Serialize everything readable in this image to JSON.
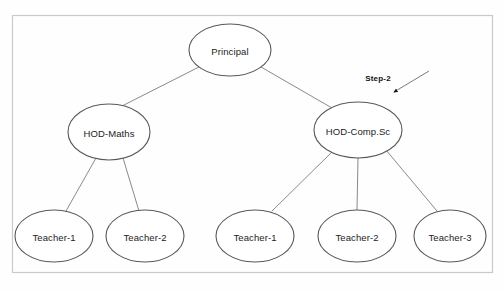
{
  "diagram": {
    "type": "organizational-hierarchy-tree",
    "frame": {
      "x": 12,
      "y": 15,
      "width": 480,
      "height": 257
    },
    "nodes": [
      {
        "id": "principal",
        "label": "Principal",
        "cx": 230,
        "cy": 50,
        "rx": 41,
        "ry": 26,
        "level": 0
      },
      {
        "id": "hod-maths",
        "label": "HOD-Maths",
        "cx": 109,
        "cy": 132,
        "rx": 41,
        "ry": 28,
        "level": 1
      },
      {
        "id": "hod-comp-sc",
        "label": "HOD-Comp.Sc",
        "cx": 358,
        "cy": 130,
        "rx": 44,
        "ry": 28,
        "level": 1
      },
      {
        "id": "teacher-m1",
        "label": "Teacher-1",
        "cx": 54,
        "cy": 236,
        "rx": 39,
        "ry": 26,
        "level": 2
      },
      {
        "id": "teacher-m2",
        "label": "Teacher-2",
        "cx": 145,
        "cy": 236,
        "rx": 39,
        "ry": 26,
        "level": 2
      },
      {
        "id": "teacher-c1",
        "label": "Teacher-1",
        "cx": 255,
        "cy": 236,
        "rx": 39,
        "ry": 26,
        "level": 2
      },
      {
        "id": "teacher-c2",
        "label": "Teacher-2",
        "cx": 357,
        "cy": 236,
        "rx": 39,
        "ry": 26,
        "level": 2
      },
      {
        "id": "teacher-c3",
        "label": "Teacher-3",
        "cx": 450,
        "cy": 236,
        "rx": 36,
        "ry": 26,
        "level": 2
      }
    ],
    "edges": [
      {
        "from": "principal",
        "to": "hod-maths",
        "x1": 199,
        "y1": 67,
        "x2": 122,
        "y2": 106
      },
      {
        "from": "principal",
        "to": "hod-comp-sc",
        "x1": 261,
        "y1": 67,
        "x2": 332,
        "y2": 108
      },
      {
        "from": "hod-maths",
        "to": "teacher-m1",
        "x1": 96,
        "y1": 158,
        "x2": 66,
        "y2": 211
      },
      {
        "from": "hod-maths",
        "to": "teacher-m2",
        "x1": 123,
        "y1": 158,
        "x2": 139,
        "y2": 211
      },
      {
        "from": "hod-comp-sc",
        "to": "teacher-c1",
        "x1": 332,
        "y1": 152,
        "x2": 272,
        "y2": 211
      },
      {
        "from": "hod-comp-sc",
        "to": "teacher-c2",
        "x1": 358,
        "y1": 158,
        "x2": 357,
        "y2": 210
      },
      {
        "from": "hod-comp-sc",
        "to": "teacher-c3",
        "x1": 386,
        "y1": 150,
        "x2": 437,
        "y2": 211
      }
    ],
    "annotation": {
      "label": "Step-2",
      "label_x": 378,
      "label_y": 78,
      "arrow": {
        "x1": 429,
        "y1": 71,
        "x2": 394,
        "y2": 92
      },
      "target": "hod-comp-sc"
    }
  },
  "colors": {
    "background": "#fefefe",
    "frame_stroke": "#c9c9c9",
    "node_stroke": "#585858",
    "edge_stroke": "#8a8a8a",
    "text": "#1c1c1c",
    "annotation_text": "#111111",
    "annotation_arrow": "#7a7a7a"
  }
}
